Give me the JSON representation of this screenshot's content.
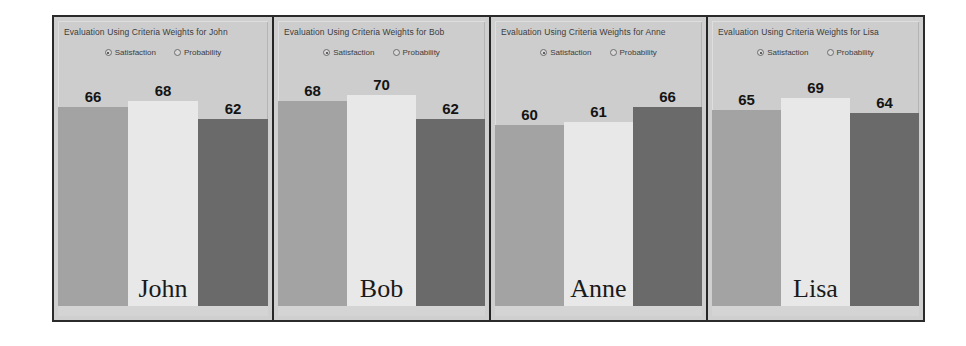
{
  "figure": {
    "background": "#ffffff",
    "frame_border_color": "#2b2b2b",
    "panel_background": "#cdcdcd"
  },
  "options": {
    "satisfaction_label": "Satisfaction",
    "probability_label": "Probability",
    "selected": "Satisfaction"
  },
  "panels": [
    {
      "title": "Evaluation Using Criteria Weights for John",
      "name": "John",
      "values": [
        66,
        68,
        62
      ]
    },
    {
      "title": "Evaluation Using Criteria Weights for Bob",
      "name": "Bob",
      "values": [
        68,
        70,
        62
      ]
    },
    {
      "title": "Evaluation Using Criteria Weights for Anne",
      "name": "Anne",
      "values": [
        60,
        61,
        66
      ]
    },
    {
      "title": "Evaluation Using Criteria Weights for Lisa",
      "name": "Lisa",
      "values": [
        65,
        69,
        64
      ]
    }
  ],
  "chart_data": {
    "type": "bar",
    "title": "Evaluation Using Criteria Weights",
    "xlabel": "",
    "ylabel": "",
    "ylim": [
      0,
      80
    ],
    "grid": false,
    "legend": "none",
    "categories": [
      "John",
      "Bob",
      "Anne",
      "Lisa"
    ],
    "series": [
      {
        "name": "bar-1",
        "color": "#a3a3a3",
        "values": [
          66,
          68,
          60,
          65
        ]
      },
      {
        "name": "bar-2",
        "color": "#e8e8e8",
        "values": [
          68,
          70,
          61,
          69
        ]
      },
      {
        "name": "bar-3",
        "color": "#6a6a6a",
        "values": [
          62,
          62,
          66,
          64
        ]
      }
    ],
    "panels": [
      {
        "label": "John",
        "values": [
          66,
          68,
          62
        ]
      },
      {
        "label": "Bob",
        "values": [
          68,
          70,
          62
        ]
      },
      {
        "label": "Anne",
        "values": [
          60,
          61,
          66
        ]
      },
      {
        "label": "Lisa",
        "values": [
          65,
          69,
          64
        ]
      }
    ],
    "annotations": [
      "Satisfaction",
      "Probability"
    ]
  }
}
